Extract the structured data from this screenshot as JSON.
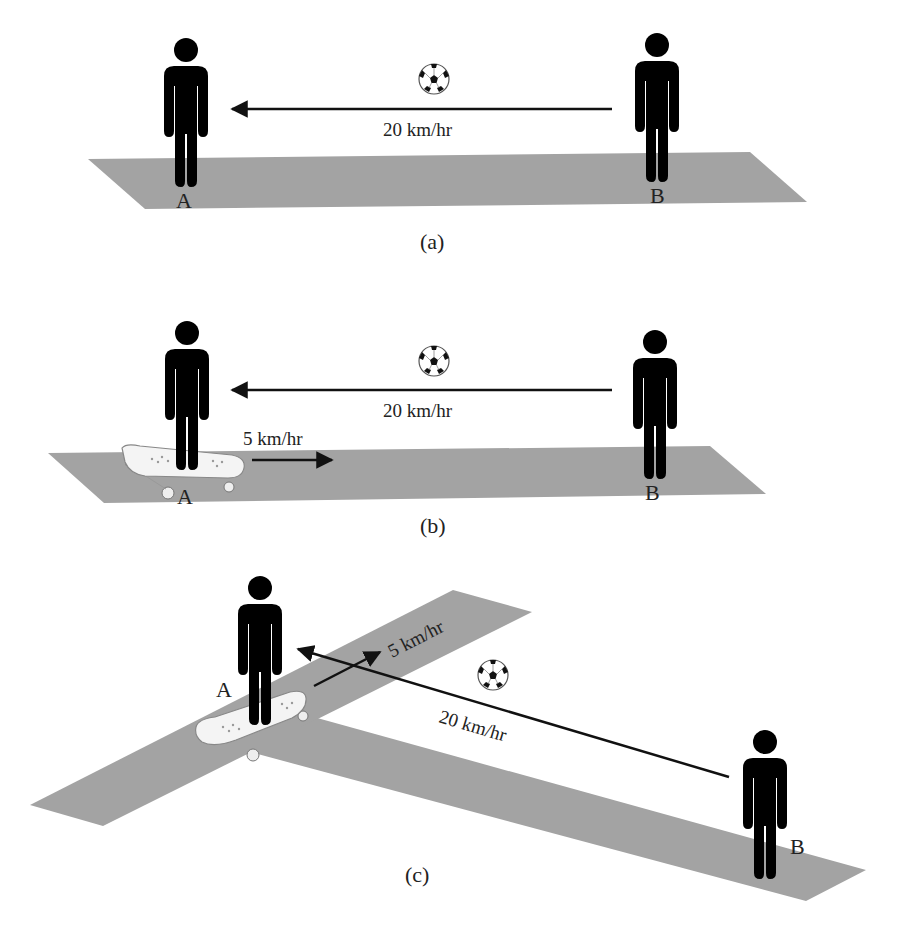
{
  "colors": {
    "ground": "#a3a3a3",
    "figure": "#000000",
    "arrow": "#111111",
    "skateboard": "#f4f4f4",
    "text": "#222222"
  },
  "panels": [
    {
      "id": "a",
      "caption": "(a)",
      "person_a_label": "A",
      "person_b_label": "B",
      "ball_speed": "20 km/hr",
      "ball_direction": "from B toward A",
      "skateboard": false
    },
    {
      "id": "b",
      "caption": "(b)",
      "person_a_label": "A",
      "person_b_label": "B",
      "ball_speed": "20 km/hr",
      "ball_direction": "from B toward A",
      "skateboard": true,
      "skateboard_speed": "5 km/hr",
      "skateboard_direction": "toward B"
    },
    {
      "id": "c",
      "caption": "(c)",
      "person_a_label": "A",
      "person_b_label": "B",
      "ball_speed": "20 km/hr",
      "ball_direction": "from B toward A",
      "skateboard": true,
      "skateboard_speed": "5 km/hr",
      "skateboard_direction": "along perpendicular road"
    }
  ],
  "icons": {
    "ball": "soccer-ball-icon",
    "person": "person-icon",
    "skateboard": "skateboard-icon"
  }
}
